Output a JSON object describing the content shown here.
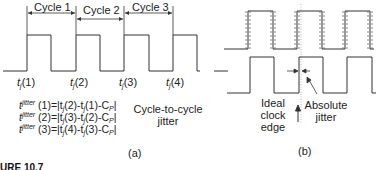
{
  "panel_a": {
    "cycle_labels": [
      "Cycle 1",
      "Cycle 2",
      "Cycle 3"
    ],
    "edge_labels": [
      {
        "base": "t",
        "sub": "j",
        "arg": "(1)"
      },
      {
        "base": "t",
        "sub": "j",
        "arg": "(2)"
      },
      {
        "base": "t",
        "sub": "j",
        "arg": "(3)"
      },
      {
        "base": "t",
        "sub": "j",
        "arg": "(4)"
      }
    ],
    "equations": [
      {
        "lhs_base": "t",
        "lhs_sub": "j",
        "lhs_sup": "jitter",
        "index": "(1)",
        "rhs": "=|t",
        "rhs_sub": "j",
        "rhs_tail_a": "(2)-t",
        "rhs_sub2": "j",
        "rhs_tail_b": "(1)-C",
        "rhs_sub3": "P",
        "close": "|"
      },
      {
        "lhs_base": "t",
        "lhs_sub": "j",
        "lhs_sup": "jitter",
        "index": "(2)",
        "rhs": "=|t",
        "rhs_sub": "j",
        "rhs_tail_a": "(3)-t",
        "rhs_sub2": "j",
        "rhs_tail_b": "(2)-C",
        "rhs_sub3": "P",
        "close": "|"
      },
      {
        "lhs_base": "t",
        "lhs_sub": "j",
        "lhs_sup": "jitter",
        "index": "(3)",
        "rhs": "=|t",
        "rhs_sub": "j",
        "rhs_tail_a": "(4)-t",
        "rhs_sub2": "j",
        "rhs_tail_b": "(3)-C",
        "rhs_sub3": "P",
        "close": "|"
      }
    ],
    "description_line1": "Cycle-to-cycle",
    "description_line2": "jitter",
    "panel_label": "(a)"
  },
  "panel_b": {
    "ideal_edge_label": [
      "Ideal",
      "clock",
      "edge"
    ],
    "absolute_jitter_label": [
      "Absolute",
      "jitter"
    ],
    "panel_label": "(b)"
  },
  "caption": "URE 10.7",
  "colors": {
    "line": "#333333",
    "dashed": "#666666"
  }
}
